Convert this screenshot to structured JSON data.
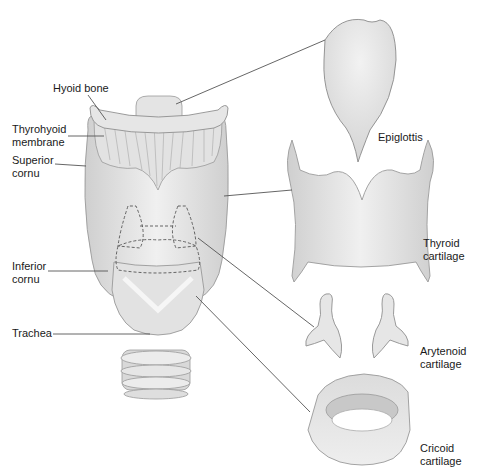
{
  "figure": {
    "labels": {
      "hyoid_bone": "Hyoid bone",
      "thyrohyoid_membrane": "Thyrohyoid\nmembrane",
      "superior_cornu": "Superior\ncornu",
      "inferior_cornu": "Inferior\ncornu",
      "trachea": "Trachea",
      "epiglottis": "Epiglottis",
      "thyroid_cartilage": "Thyroid\ncartilage",
      "arytenoid_cartilage": "Arytenoid\ncartilage",
      "cricoid_cartilage": "Cricoid\ncartilage"
    },
    "colors": {
      "cartilage_fill": "#e9e9e9",
      "cartilage_shade": "#cfcfcf",
      "outline": "#8a8a8a",
      "leader_line": "#555555",
      "text": "#1a1a1a"
    }
  }
}
